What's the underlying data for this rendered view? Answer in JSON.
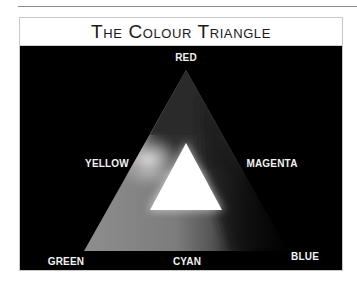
{
  "title": "The Colour Triangle",
  "labels": {
    "top": "RED",
    "upper_left": "YELLOW",
    "upper_right": "MAGENTA",
    "bottom_left": "GREEN",
    "bottom_middle": "CYAN",
    "bottom_right": "BLUE"
  },
  "colors": {
    "background": "#000000",
    "label_text": "#f2f2f2",
    "title_text": "#1a1a1a",
    "center": "#ffffff"
  },
  "vertices": {
    "red": "top",
    "green": "bottom-left",
    "blue": "bottom-right"
  },
  "secondaries": {
    "yellow": "between red and green",
    "magenta": "between red and blue",
    "cyan": "between green and blue"
  },
  "center_label": "white (all colours combined)"
}
